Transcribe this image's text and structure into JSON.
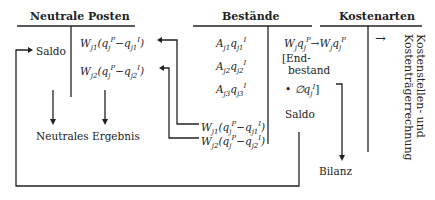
{
  "headers": {
    "neutral": "Neutrale  Posten",
    "stocks": "Bestände",
    "cost_types": "Kostenarten"
  },
  "neutral": {
    "saldo": "Saldo",
    "item1": "Wj1(qjP − qj1I)",
    "item2": "Wj2(qjP − qj2I)",
    "result": "Neutrales Ergebnis"
  },
  "stocks": {
    "debit": [
      "Aj1qj1I",
      "Aj2qj2I",
      "Aj3qj3I"
    ],
    "credit_transfer1": "Wj1(qjP − qj1I)",
    "credit_transfer2": "Wj2(qjP − qj2I)",
    "cost_entry": "WjqjP → WjqjP",
    "end_stock_line1": "[End-",
    "end_stock_line2": "bestand",
    "end_stock_line3": "• ∅qjI]",
    "saldo": "Saldo",
    "balance": "Bilanz"
  },
  "cost_types": {
    "arrow": "→",
    "target_line1": "Kostenstellen- und",
    "target_line2": "Kostenträgerrechnung"
  }
}
